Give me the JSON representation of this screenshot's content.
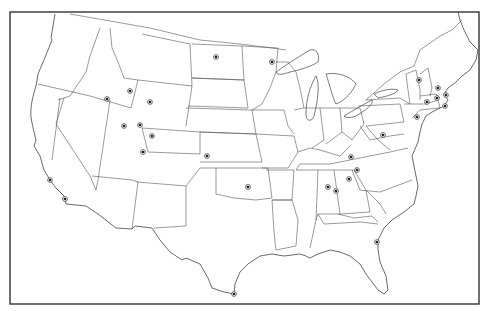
{
  "map": {
    "title": "",
    "type": "outline map of the contiguous United States with location markers",
    "frame": {
      "x": 10,
      "y": 12,
      "width": 469,
      "height": 292
    },
    "colors": {
      "line": "#555555",
      "marker": "#222222",
      "background": "#ffffff"
    },
    "markers": [
      {
        "id": "m1",
        "region": "North Dakota",
        "x": 216,
        "y": 57
      },
      {
        "id": "m2",
        "region": "Minnesota",
        "x": 272,
        "y": 62
      },
      {
        "id": "m3",
        "region": "Idaho",
        "x": 107,
        "y": 99
      },
      {
        "id": "m4",
        "region": "Idaho/Wyoming border",
        "x": 130,
        "y": 91
      },
      {
        "id": "m5",
        "region": "Wyoming",
        "x": 150,
        "y": 102
      },
      {
        "id": "m6",
        "region": "Utah",
        "x": 124,
        "y": 126
      },
      {
        "id": "m7",
        "region": "Utah/Wyoming",
        "x": 140,
        "y": 125
      },
      {
        "id": "m8",
        "region": "Colorado",
        "x": 152,
        "y": 136
      },
      {
        "id": "m9",
        "region": "Colorado south",
        "x": 143,
        "y": 152
      },
      {
        "id": "m10",
        "region": "Kansas",
        "x": 207,
        "y": 156
      },
      {
        "id": "m11",
        "region": "California north",
        "x": 50,
        "y": 180
      },
      {
        "id": "m12",
        "region": "California south",
        "x": 65,
        "y": 199
      },
      {
        "id": "m13",
        "region": "Oklahoma",
        "x": 248,
        "y": 187
      },
      {
        "id": "m14",
        "region": "Vermont",
        "x": 419,
        "y": 80
      },
      {
        "id": "m15",
        "region": "New Hampshire",
        "x": 438,
        "y": 88
      },
      {
        "id": "m16",
        "region": "Massachusetts",
        "x": 437,
        "y": 98
      },
      {
        "id": "m17",
        "region": "Connecticut",
        "x": 427,
        "y": 102
      },
      {
        "id": "m18",
        "region": "Rhode Island",
        "x": 445,
        "y": 106
      },
      {
        "id": "m19",
        "region": "Maine coast",
        "x": 446,
        "y": 95
      },
      {
        "id": "m20",
        "region": "New Jersey",
        "x": 417,
        "y": 117
      },
      {
        "id": "m21",
        "region": "Pennsylvania",
        "x": 383,
        "y": 135
      },
      {
        "id": "m22",
        "region": "West Virginia",
        "x": 350,
        "y": 157
      },
      {
        "id": "m23",
        "region": "Kentucky",
        "x": 351,
        "y": 157
      },
      {
        "id": "m24",
        "region": "Virginia/Tennessee",
        "x": 357,
        "y": 170
      },
      {
        "id": "m25",
        "region": "Tennessee east",
        "x": 349,
        "y": 179
      },
      {
        "id": "m26",
        "region": "Tennessee",
        "x": 328,
        "y": 187
      },
      {
        "id": "m27",
        "region": "Tennessee south",
        "x": 336,
        "y": 191
      },
      {
        "id": "m28",
        "region": "Florida",
        "x": 377,
        "y": 242
      },
      {
        "id": "m29",
        "region": "Texas south tip",
        "x": 234,
        "y": 294
      }
    ]
  }
}
